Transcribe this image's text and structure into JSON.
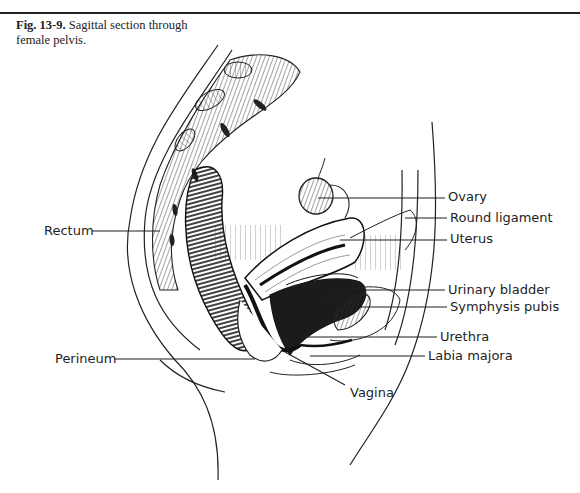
{
  "caption": {
    "figure_number": "Fig. 13-9.",
    "text": "Sagittal section through female pelvis."
  },
  "labels": {
    "ovary": "Ovary",
    "round_ligament": "Round ligament",
    "uterus": "Uterus",
    "urinary_bladder": "Urinary bladder",
    "symphysis_pubis": "Symphysis pubis",
    "urethra": "Urethra",
    "labia_majora": "Labia majora",
    "rectum": "Rectum",
    "perineum": "Perineum",
    "vagina": "Vagina"
  },
  "colors": {
    "ink": "#1e1e1e",
    "background": "#ffffff"
  }
}
